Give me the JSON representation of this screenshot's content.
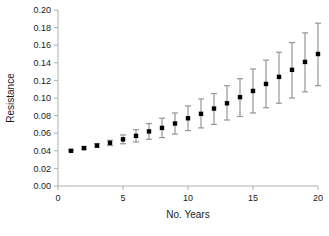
{
  "chart_data": {
    "type": "scatter",
    "title": "",
    "xlabel": "No. Years",
    "ylabel": "Resistance",
    "xlim": [
      0,
      20
    ],
    "ylim": [
      0.0,
      0.2
    ],
    "xticks": [
      0,
      5,
      10,
      15,
      20
    ],
    "xtick_labels": [
      "0",
      "5",
      "10",
      "15",
      "20"
    ],
    "yticks": [
      0.0,
      0.02,
      0.04,
      0.06,
      0.08,
      0.1,
      0.12,
      0.14,
      0.16,
      0.18,
      0.2
    ],
    "ytick_labels": [
      "0.00",
      "0.02",
      "0.04",
      "0.06",
      "0.08",
      "0.10",
      "0.12",
      "0.14",
      "0.16",
      "0.18",
      "0.20"
    ],
    "grid": false,
    "legend": false,
    "marker": "square",
    "marker_color": "#000000",
    "errorbar_color": "#969696",
    "axis_color": "#b0b0b0",
    "x": [
      1,
      2,
      3,
      4,
      5,
      6,
      7,
      8,
      9,
      10,
      11,
      12,
      13,
      14,
      15,
      16,
      17,
      18,
      19,
      20
    ],
    "values": [
      0.04,
      0.043,
      0.046,
      0.049,
      0.053,
      0.057,
      0.062,
      0.066,
      0.071,
      0.077,
      0.082,
      0.088,
      0.094,
      0.101,
      0.108,
      0.116,
      0.124,
      0.132,
      0.141,
      0.15
    ],
    "err_low": [
      0.04,
      0.042,
      0.044,
      0.046,
      0.048,
      0.05,
      0.053,
      0.055,
      0.059,
      0.063,
      0.066,
      0.07,
      0.075,
      0.079,
      0.083,
      0.089,
      0.094,
      0.1,
      0.107,
      0.114
    ],
    "err_high": [
      0.041,
      0.045,
      0.048,
      0.052,
      0.058,
      0.064,
      0.071,
      0.077,
      0.083,
      0.091,
      0.099,
      0.105,
      0.114,
      0.122,
      0.133,
      0.143,
      0.152,
      0.163,
      0.174,
      0.185
    ],
    "series": [
      {
        "name": "Resistance",
        "values": [
          0.04,
          0.043,
          0.046,
          0.049,
          0.053,
          0.057,
          0.062,
          0.066,
          0.071,
          0.077,
          0.082,
          0.088,
          0.094,
          0.101,
          0.108,
          0.116,
          0.124,
          0.132,
          0.141,
          0.15
        ]
      }
    ]
  }
}
